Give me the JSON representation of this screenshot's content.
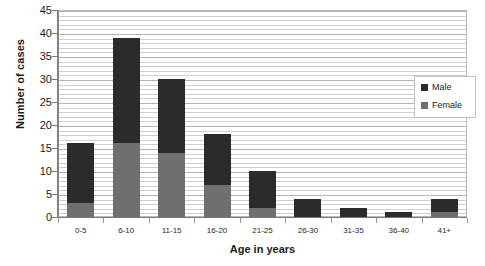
{
  "chart_data": {
    "type": "bar",
    "subtype": "stacked-vertical-bar",
    "title": "",
    "xlabel": "Age in years",
    "ylabel": "Number of cases",
    "categories": [
      "0-5",
      "6-10",
      "11-15",
      "16-20",
      "21-25",
      "26-30",
      "31-35",
      "36-40",
      "41+"
    ],
    "series": [
      {
        "name": "Female",
        "color": "#6f6f6f",
        "values": [
          3,
          16,
          14,
          7,
          2,
          0,
          0,
          0,
          1
        ]
      },
      {
        "name": "Male",
        "color": "#2b2b2b",
        "values": [
          13,
          23,
          16,
          11,
          8,
          4,
          2,
          1,
          3
        ]
      }
    ],
    "totals": [
      16,
      39,
      30,
      18,
      10,
      4,
      2,
      1,
      4
    ],
    "ylim": [
      0,
      45
    ],
    "y_ticks": [
      0,
      5,
      10,
      15,
      20,
      25,
      30,
      35,
      40,
      45
    ],
    "y_tick_labels": [
      "0",
      "5",
      "10",
      "15",
      "20",
      "25",
      "30",
      "35",
      "40",
      "45"
    ],
    "grid": {
      "horizontal_major": true,
      "horizontal_minor": true,
      "minor_step": 1,
      "vertical": false
    },
    "legend": {
      "position": "right-inside",
      "entries": [
        {
          "label": "Male",
          "color": "#2b2b2b"
        },
        {
          "label": "Female",
          "color": "#6f6f6f"
        }
      ]
    },
    "plot_border": true,
    "background": "#ffffff"
  }
}
